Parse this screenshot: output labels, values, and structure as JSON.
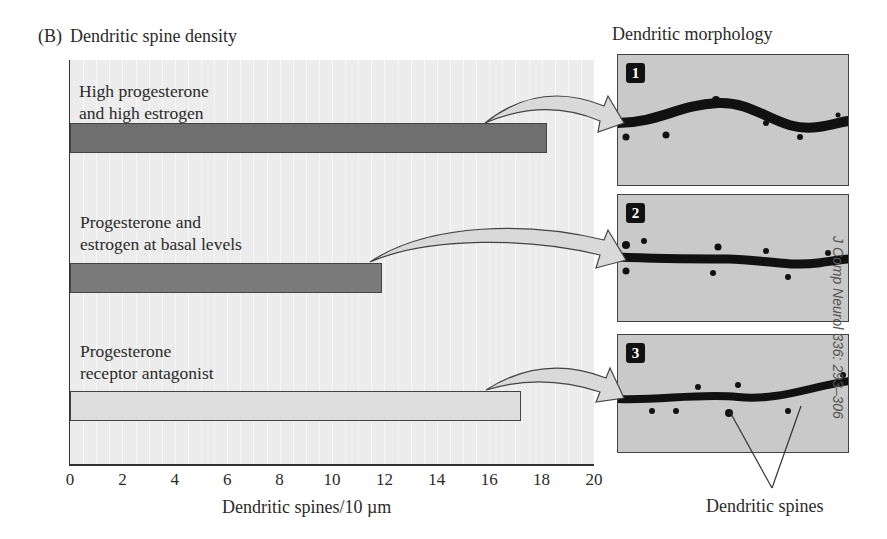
{
  "figure": {
    "panel_label": "(B)",
    "left_title": "Dendritic spine density",
    "right_title": "Dendritic morphology",
    "citation": "J Comp Neurol 336: 293–306",
    "spines_annotation": "Dendritic spines"
  },
  "conditions": [
    {
      "line1": "High progesterone",
      "line2": "and high estrogen",
      "badge": "1"
    },
    {
      "line1": "Progesterone and",
      "line2": "estrogen at basal levels",
      "badge": "2"
    },
    {
      "line1": "Progesterone",
      "line2": "receptor antagonist",
      "badge": "3"
    }
  ],
  "axis": {
    "ticks": [
      "0",
      "2",
      "4",
      "6",
      "8",
      "10",
      "12",
      "14",
      "16",
      "18",
      "20"
    ],
    "xlabel": "Dendritic spines/10 µm"
  },
  "colors": {
    "bar_high": "#6f6f6f",
    "bar_basal": "#7a7a7a",
    "bar_antagonist": "#dedede",
    "plot_bg": "#ececec",
    "arrow_fill": "#d9d9d9"
  },
  "chart_data": {
    "type": "bar",
    "orientation": "horizontal",
    "title": "Dendritic spine density",
    "categories": [
      "High progesterone and high estrogen",
      "Progesterone and estrogen at basal levels",
      "Progesterone receptor antagonist"
    ],
    "values": [
      18.2,
      11.9,
      17.2
    ],
    "xlabel": "Dendritic spines/10 µm",
    "ylabel": "",
    "xlim": [
      0,
      20
    ],
    "xticks": [
      0,
      2,
      4,
      6,
      8,
      10,
      12,
      14,
      16,
      18,
      20
    ],
    "grid": false,
    "legend": "none",
    "annotations": [
      "Arrows link each bar to micrograph panels 1, 2, 3 (Dendritic morphology)",
      "Dendritic spines (pointer to panel 3)"
    ]
  }
}
